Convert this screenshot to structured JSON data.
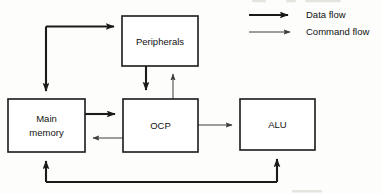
{
  "diagram": {
    "nodes": [
      {
        "id": "peripherals",
        "label": "Peripherals",
        "x": 122,
        "y": 16,
        "w": 76,
        "h": 50
      },
      {
        "id": "main-memory",
        "label_line1": "Main",
        "label_line2": "memory",
        "x": 8,
        "y": 99,
        "w": 77,
        "h": 53
      },
      {
        "id": "ocp",
        "label": "OCP",
        "x": 123,
        "y": 99,
        "w": 75,
        "h": 53
      },
      {
        "id": "alu",
        "label": "ALU",
        "x": 240,
        "y": 99,
        "w": 75,
        "h": 51
      }
    ],
    "edges": [
      {
        "id": "peripherals-to-main-memory",
        "from": "peripherals",
        "to": "main-memory",
        "type": "data"
      },
      {
        "id": "peripherals-to-ocp",
        "from": "peripherals",
        "to": "ocp",
        "type": "data"
      },
      {
        "id": "ocp-to-peripherals",
        "from": "ocp",
        "to": "peripherals",
        "type": "command"
      },
      {
        "id": "main-memory-to-ocp",
        "from": "main-memory",
        "to": "ocp",
        "type": "data"
      },
      {
        "id": "ocp-to-main-memory",
        "from": "ocp",
        "to": "main-memory",
        "type": "command"
      },
      {
        "id": "ocp-to-alu",
        "from": "ocp",
        "to": "alu",
        "type": "command"
      },
      {
        "id": "alu-to-main-memory",
        "from": "alu",
        "to": "main-memory",
        "type": "data"
      }
    ]
  },
  "legend": {
    "items": [
      {
        "id": "data-flow",
        "label": "Data flow",
        "type": "data",
        "color": "#1a1a1a"
      },
      {
        "id": "command-flow",
        "label": "Command flow",
        "type": "command",
        "color": "#3d3d3d"
      }
    ]
  }
}
